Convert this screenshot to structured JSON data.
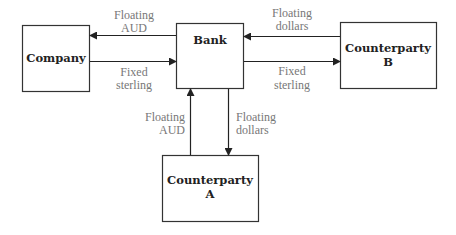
{
  "nodes": {
    "company": {
      "label": "Company"
    },
    "bank": {
      "label": "Bank"
    },
    "counterparty_b": {
      "line1": "Counterparty",
      "line2": "B"
    },
    "counterparty_a": {
      "line1": "Counterparty",
      "line2": "A"
    }
  },
  "flows": {
    "bank_to_company": {
      "line1": "Floating",
      "line2": "AUD"
    },
    "company_to_bank": {
      "line1": "Fixed",
      "line2": "sterling"
    },
    "b_to_bank": {
      "line1": "Floating",
      "line2": "dollars"
    },
    "bank_to_b": {
      "line1": "Fixed",
      "line2": "sterling"
    },
    "a_to_bank": {
      "line1": "Floating",
      "line2": "AUD"
    },
    "bank_to_a": {
      "line1": "Floating",
      "line2": "dollars"
    }
  },
  "colors": {
    "stroke": "#222222",
    "flow_text": "#777777",
    "box_text": "#222222"
  }
}
